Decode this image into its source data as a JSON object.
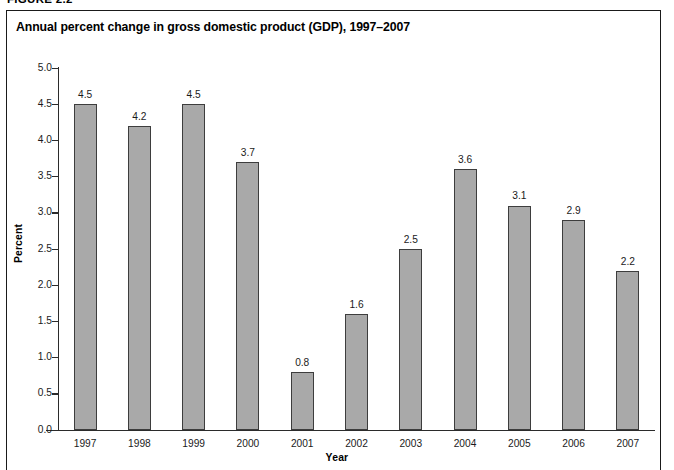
{
  "figure": {
    "label": "FIGURE 2.2",
    "title": "Annual percent change in gross domestic product (GDP), 1997–2007"
  },
  "chart_data": {
    "type": "bar",
    "title": "Annual percent change in gross domestic product (GDP), 1997–2007",
    "xlabel": "Year",
    "ylabel": "Percent",
    "ylim": [
      0.0,
      5.0
    ],
    "ytick_labels": [
      "5.0",
      "4.5",
      "4.0",
      "3.5",
      "3.0",
      "2.5",
      "2.0",
      "1.5",
      "1.0",
      "0.5",
      "0.0"
    ],
    "yticks": [
      5.0,
      4.5,
      4.0,
      3.5,
      3.0,
      2.5,
      2.0,
      1.5,
      1.0,
      0.5,
      0.0
    ],
    "grid": false,
    "legend": null,
    "categories": [
      "1997",
      "1998",
      "1999",
      "2000",
      "2001",
      "2002",
      "2003",
      "2004",
      "2005",
      "2006",
      "2007"
    ],
    "values": [
      4.5,
      4.2,
      4.5,
      3.7,
      0.8,
      1.6,
      2.5,
      3.6,
      3.1,
      2.9,
      2.2
    ],
    "data_labels": [
      "4.5",
      "4.2",
      "4.5",
      "3.7",
      "0.8",
      "1.6",
      "2.5",
      "3.6",
      "3.1",
      "2.9",
      "2.2"
    ],
    "bar_color": "#a9a9a9",
    "bar_border_color": "#3d3d3d",
    "axis_color": "#2b2b2b"
  }
}
